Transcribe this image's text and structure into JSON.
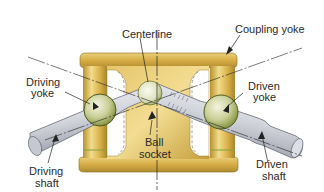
{
  "diagram": {
    "type": "mechanical-cross-section",
    "labels": {
      "centerline": "Centerline",
      "coupling_yoke": "Coupling yoke",
      "driving_yoke_1": "Driving",
      "driving_yoke_2": "yoke",
      "driven_yoke_1": "Driven",
      "driven_yoke_2": "yoke",
      "ball_socket_1": "Ball",
      "ball_socket_2": "socket",
      "driving_shaft_1": "Driving",
      "driving_shaft_2": "shaft",
      "driven_shaft_1": "Driven",
      "driven_shaft_2": "shaft"
    },
    "colors": {
      "yoke_gold": "#d9b24a",
      "yoke_highlight": "#f2dc8c",
      "yoke_shadow": "#a8862c",
      "shaft_gray": "#b9bcc6",
      "shaft_highlight": "#eceef3",
      "ball_green": "#c9cf95",
      "ball_edge": "#6d7a2e",
      "line": "#222222"
    }
  }
}
